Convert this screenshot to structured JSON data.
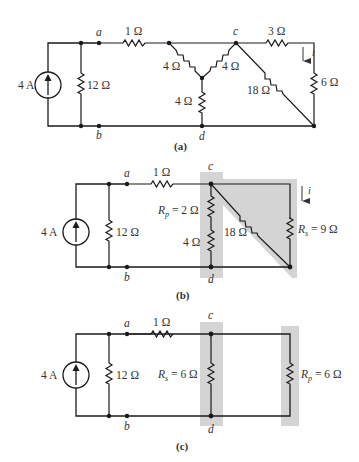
{
  "figure": {
    "panels": [
      {
        "id": "a",
        "caption": "(a)",
        "source": "4 A",
        "resistors": {
          "r12": "12 Ω",
          "r1": "1 Ω",
          "y_left": "4 Ω",
          "y_right": "4 Ω",
          "y_bottom": "4 Ω",
          "r3": "3 Ω",
          "r18": "18 Ω",
          "r6": "6 Ω"
        },
        "nodes": {
          "a": "a",
          "b": "b",
          "c": "c",
          "d": "d"
        },
        "current": "i"
      },
      {
        "id": "b",
        "caption": "(b)",
        "source": "4 A",
        "resistors": {
          "r12": "12 Ω",
          "r1": "1 Ω",
          "rp_label": "R",
          "rp_sub": "p",
          "rp_value": " = 2 Ω",
          "r4": "4 Ω",
          "r18": "18 Ω",
          "rs_label": "R",
          "rs_sub": "s",
          "rs_value": " = 9 Ω"
        },
        "nodes": {
          "a": "a",
          "b": "b",
          "c": "c",
          "d": "d"
        },
        "current": "i"
      },
      {
        "id": "c",
        "caption": "(c)",
        "source": "4 A",
        "resistors": {
          "r12": "12 Ω",
          "r1": "1 Ω",
          "rs_label": "R",
          "rs_sub": "s",
          "rs_value": " = 6 Ω",
          "rp_label": "R",
          "rp_sub": "p",
          "rp_value": " = 6 Ω"
        },
        "nodes": {
          "a": "a",
          "b": "b",
          "c": "c",
          "d": "d"
        }
      }
    ],
    "colors": {
      "wire": "#1a1a1a",
      "shading": "#d4d4d4",
      "text": "#333333"
    }
  }
}
